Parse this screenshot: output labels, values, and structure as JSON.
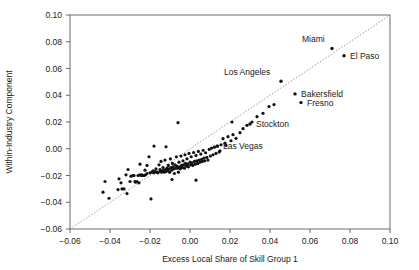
{
  "chart_data": {
    "type": "scatter",
    "title": "",
    "xlabel": "Excess Local Share of Skill Group 1",
    "ylabel": "Within-Industry Component",
    "xlim": [
      -0.06,
      0.1
    ],
    "ylim": [
      -0.06,
      0.1
    ],
    "xticks": [
      -0.06,
      -0.04,
      -0.02,
      0.0,
      0.02,
      0.04,
      0.06,
      0.08,
      0.1
    ],
    "yticks": [
      -0.06,
      -0.04,
      -0.02,
      0.0,
      0.02,
      0.04,
      0.06,
      0.08,
      0.1
    ],
    "xtick_labels": [
      "-0.06",
      "-0.04",
      "-0.02",
      "0.00",
      "0.02",
      "0.04",
      "0.06",
      "0.08",
      "0.10"
    ],
    "ytick_labels": [
      "-0.06",
      "-0.04",
      "-0.02",
      "0.00",
      "0.02",
      "0.04",
      "0.06",
      "0.08",
      "0.10"
    ],
    "grid": false,
    "legend": "none",
    "reference_line": {
      "name": "45-degree-line",
      "style": "dotted",
      "from": [
        -0.06,
        -0.06
      ],
      "to": [
        0.1,
        0.1
      ]
    },
    "annotations": [
      {
        "label": "Miami",
        "x": 0.071,
        "y": 0.075,
        "label_dx": -30,
        "label_dy": -6
      },
      {
        "label": "El Paso",
        "x": 0.077,
        "y": 0.0695,
        "label_dx": 6,
        "label_dy": 3
      },
      {
        "label": "Los Angeles",
        "x": 0.0455,
        "y": 0.0505,
        "label_dx": -57,
        "label_dy": -6
      },
      {
        "label": "Bakersfield",
        "x": 0.0525,
        "y": 0.041,
        "label_dx": 6,
        "label_dy": 3
      },
      {
        "label": "Fresno",
        "x": 0.0555,
        "y": 0.0345,
        "label_dx": 6,
        "label_dy": 3
      },
      {
        "label": "Stockton",
        "x": 0.03,
        "y": 0.0185,
        "label_dx": 6,
        "label_dy": 3
      },
      {
        "label": "Las Vegas",
        "x": 0.0135,
        "y": 0.002,
        "label_dx": 6,
        "label_dy": 3
      }
    ],
    "points": [
      [
        -0.0435,
        -0.0325
      ],
      [
        -0.0405,
        -0.037
      ],
      [
        -0.036,
        -0.0305
      ],
      [
        -0.0345,
        -0.0255
      ],
      [
        -0.034,
        -0.03
      ],
      [
        -0.033,
        -0.03
      ],
      [
        -0.032,
        -0.0195
      ],
      [
        -0.0315,
        -0.0335
      ],
      [
        -0.03,
        -0.0245
      ],
      [
        -0.0295,
        -0.0205
      ],
      [
        -0.0285,
        -0.02
      ],
      [
        -0.028,
        -0.02
      ],
      [
        -0.0275,
        -0.0245
      ],
      [
        -0.0272,
        -0.025
      ],
      [
        -0.0265,
        -0.0245
      ],
      [
        -0.026,
        -0.02
      ],
      [
        -0.0255,
        -0.0255
      ],
      [
        -0.025,
        -0.0195
      ],
      [
        -0.0245,
        -0.02
      ],
      [
        -0.024,
        -0.0195
      ],
      [
        -0.0235,
        -0.02
      ],
      [
        -0.023,
        -0.02
      ],
      [
        -0.0225,
        -0.016
      ],
      [
        -0.0222,
        -0.0195
      ],
      [
        -0.0215,
        -0.0185
      ],
      [
        -0.0205,
        -0.006
      ],
      [
        -0.02,
        -0.018
      ],
      [
        -0.0195,
        -0.0375
      ],
      [
        -0.019,
        -0.0175
      ],
      [
        -0.0185,
        -0.0165
      ],
      [
        -0.018,
        -0.018
      ],
      [
        -0.0175,
        -0.017
      ],
      [
        -0.017,
        -0.015
      ],
      [
        -0.0165,
        -0.0175
      ],
      [
        -0.016,
        -0.018
      ],
      [
        -0.0155,
        -0.012
      ],
      [
        -0.015,
        -0.0155
      ],
      [
        -0.0148,
        -0.017
      ],
      [
        -0.0145,
        -0.0095
      ],
      [
        -0.0142,
        -0.0175
      ],
      [
        -0.0138,
        -0.0165
      ],
      [
        -0.0135,
        -0.014
      ],
      [
        -0.013,
        -0.016
      ],
      [
        -0.0128,
        -0.0175
      ],
      [
        -0.0125,
        -0.0085
      ],
      [
        -0.0122,
        -0.0155
      ],
      [
        -0.0118,
        -0.017
      ],
      [
        -0.0115,
        -0.0145
      ],
      [
        -0.0112,
        -0.016
      ],
      [
        -0.0108,
        -0.0125
      ],
      [
        -0.0105,
        -0.015
      ],
      [
        -0.0102,
        -0.0175
      ],
      [
        -0.0098,
        -0.0075
      ],
      [
        -0.0095,
        -0.014
      ],
      [
        -0.0092,
        -0.016
      ],
      [
        -0.0088,
        -0.011
      ],
      [
        -0.0085,
        -0.0135
      ],
      [
        -0.0082,
        -0.015
      ],
      [
        -0.0078,
        -0.0185
      ],
      [
        -0.0075,
        -0.012
      ],
      [
        -0.0072,
        -0.0145
      ],
      [
        -0.0068,
        -0.006
      ],
      [
        -0.0065,
        -0.013
      ],
      [
        -0.0062,
        -0.0145
      ],
      [
        -0.0058,
        -0.0175
      ],
      [
        -0.0055,
        -0.01
      ],
      [
        -0.0052,
        -0.0135
      ],
      [
        -0.0048,
        -0.015
      ],
      [
        -0.0045,
        -0.0055
      ],
      [
        -0.0042,
        -0.0125
      ],
      [
        -0.0038,
        -0.014
      ],
      [
        -0.0035,
        -0.009
      ],
      [
        -0.0032,
        -0.012
      ],
      [
        -0.0028,
        -0.0145
      ],
      [
        -0.0025,
        -0.0045
      ],
      [
        -0.0022,
        -0.011
      ],
      [
        -0.0018,
        -0.013
      ],
      [
        -0.0015,
        -0.0075
      ],
      [
        -0.0012,
        -0.0115
      ],
      [
        -0.0008,
        -0.0135
      ],
      [
        -0.0005,
        -0.0035
      ],
      [
        0.0,
        -0.01
      ],
      [
        0.0003,
        -0.012
      ],
      [
        0.0006,
        -0.006
      ],
      [
        0.001,
        -0.0105
      ],
      [
        0.0014,
        -0.0125
      ],
      [
        0.0018,
        -0.0028
      ],
      [
        0.0022,
        -0.0095
      ],
      [
        0.0026,
        -0.0115
      ],
      [
        0.003,
        -0.005
      ],
      [
        0.0034,
        -0.009
      ],
      [
        0.0038,
        -0.011
      ],
      [
        0.0042,
        -0.002
      ],
      [
        0.0046,
        -0.0085
      ],
      [
        0.005,
        -0.01
      ],
      [
        0.0054,
        -0.004
      ],
      [
        0.0058,
        -0.008
      ],
      [
        0.0062,
        -0.0095
      ],
      [
        0.0066,
        -0.0012
      ],
      [
        0.007,
        -0.007
      ],
      [
        0.0074,
        -0.009
      ],
      [
        0.0078,
        -0.003
      ],
      [
        0.0084,
        -0.0065
      ],
      [
        0.009,
        -0.0085
      ],
      [
        0.0096,
        -0.0005
      ],
      [
        0.0102,
        -0.0055
      ],
      [
        0.0108,
        0.0005
      ],
      [
        0.0115,
        -0.0045
      ],
      [
        0.0122,
        0.0012
      ],
      [
        0.013,
        -0.0035
      ],
      [
        0.0138,
        0.002
      ],
      [
        0.0146,
        -0.0025
      ],
      [
        0.0155,
        0.003
      ],
      [
        0.0165,
        0.0075
      ],
      [
        0.0175,
        0.0042
      ],
      [
        0.019,
        0.009
      ],
      [
        0.0205,
        0.006
      ],
      [
        0.0215,
        0.0105
      ],
      [
        0.023,
        0.0078
      ],
      [
        0.025,
        0.012
      ],
      [
        0.0265,
        0.015
      ],
      [
        0.0285,
        0.0175
      ],
      [
        0.031,
        0.02
      ],
      [
        0.0335,
        0.024
      ],
      [
        0.0365,
        0.0265
      ],
      [
        0.0395,
        0.0315
      ],
      [
        0.042,
        0.033
      ],
      [
        0.021,
        0.02
      ],
      [
        -0.006,
        0.0195
      ],
      [
        -0.018,
        0.002
      ],
      [
        -0.012,
        0.0015
      ],
      [
        -0.025,
        -0.0115
      ],
      [
        -0.0215,
        -0.0125
      ],
      [
        -0.031,
        -0.0155
      ],
      [
        0.003,
        -0.0235
      ],
      [
        -0.009,
        -0.023
      ],
      [
        -0.0355,
        -0.0225
      ],
      [
        -0.0425,
        -0.0245
      ],
      [
        0.015,
        -0.0015
      ],
      [
        0.018,
        0.0025
      ]
    ]
  },
  "axis_titles": {
    "x": "Excess Local Share of Skill Group 1",
    "y": "Within-Industry Component"
  }
}
